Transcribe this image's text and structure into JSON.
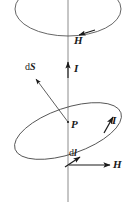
{
  "figure": {
    "name": "magnetic-field-circular-loop-diagram",
    "type": "physics-vector-diagram",
    "stroke_color": "#4d4d4d",
    "label_color": "#1a1a1a",
    "background_color": "#ffffff",
    "width": 131,
    "height": 202
  },
  "labels": {
    "h_top": "H",
    "i_axis": "I",
    "ds_prefix": "d",
    "ds_symbol": "S",
    "point_p": "P",
    "i_loop": "I",
    "dl_prefix": "d",
    "dl_symbol": "l",
    "h_bottom": "H"
  },
  "elements": {
    "vertical_axis": "current-axis-line",
    "upper_loop": "upper-ellipse-loop",
    "lower_loop": "lower-tilted-ellipse-loop",
    "h_top_arrow": "h-field-arrow-upper-loop",
    "i_axis_arrow": "current-arrow-up",
    "ds_arrow": "area-element-vector-arrow",
    "dl_arrow": "length-element-vector-arrow",
    "h_bottom_arrow": "h-field-arrow-horizontal",
    "i_loop_arrow": "current-direction-arrow-lower-loop",
    "point_marker": "field-point-p"
  }
}
